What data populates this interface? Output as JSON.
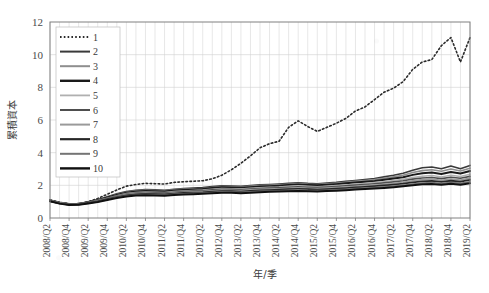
{
  "chart_data": {
    "type": "line",
    "title": "",
    "xlabel": "年/季",
    "ylabel": "累積資本",
    "ylim": [
      0,
      12
    ],
    "yticks": [
      0,
      2,
      4,
      6,
      8,
      10,
      12
    ],
    "grid": true,
    "legend_position": "top-left",
    "x": [
      "2008/Q2",
      "2008/Q3",
      "2008/Q4",
      "2009/Q1",
      "2009/Q2",
      "2009/Q3",
      "2009/Q4",
      "2010/Q1",
      "2010/Q2",
      "2010/Q3",
      "2010/Q4",
      "2011/Q1",
      "2011/Q2",
      "2011/Q3",
      "2011/Q4",
      "2012/Q1",
      "2012/Q2",
      "2012/Q3",
      "2012/Q4",
      "2013/Q1",
      "2013/Q2",
      "2013/Q3",
      "2013/Q4",
      "2014/Q1",
      "2014/Q2",
      "2014/Q3",
      "2014/Q4",
      "2015/Q1",
      "2015/Q2",
      "2015/Q3",
      "2015/Q4",
      "2016/Q1",
      "2016/Q2",
      "2016/Q3",
      "2016/Q4",
      "2017/Q1",
      "2017/Q2",
      "2017/Q3",
      "2017/Q4",
      "2018/Q1",
      "2018/Q2",
      "2018/Q3",
      "2018/Q4",
      "2019/Q1",
      "2019/Q2"
    ],
    "xticklabels": [
      "2008/Q2",
      "2008/Q4",
      "2009/Q2",
      "2009/Q4",
      "2010/Q2",
      "2010/Q4",
      "2011/Q2",
      "2011/Q4",
      "2012/Q2",
      "2012/Q4",
      "2013/Q2",
      "2013/Q4",
      "2014/Q2",
      "2014/Q4",
      "2015/Q2",
      "2015/Q4",
      "2016/Q2",
      "2016/Q4",
      "2017/Q2",
      "2017/Q4",
      "2018/Q2",
      "2018/Q4",
      "2019/Q2"
    ],
    "series": [
      {
        "name": "1",
        "style": "dotted",
        "color": "#2b2b2b",
        "width": 1.3,
        "values": [
          1.1,
          0.95,
          0.86,
          0.88,
          1.0,
          1.2,
          1.45,
          1.72,
          1.95,
          2.05,
          2.12,
          2.1,
          2.08,
          2.18,
          2.22,
          2.25,
          2.28,
          2.4,
          2.62,
          2.95,
          3.35,
          3.8,
          4.3,
          4.55,
          4.7,
          5.55,
          5.95,
          5.6,
          5.3,
          5.55,
          5.8,
          6.1,
          6.55,
          6.8,
          7.25,
          7.7,
          7.95,
          8.35,
          9.1,
          9.55,
          9.7,
          10.55,
          11.05,
          9.55,
          11.05
        ]
      },
      {
        "name": "2",
        "style": "solid",
        "color": "#3a3a3a",
        "width": 1.6,
        "values": [
          1.1,
          0.96,
          0.87,
          0.88,
          0.98,
          1.12,
          1.3,
          1.48,
          1.62,
          1.7,
          1.74,
          1.72,
          1.7,
          1.76,
          1.8,
          1.84,
          1.86,
          1.92,
          1.97,
          1.96,
          1.94,
          1.99,
          2.03,
          2.05,
          2.08,
          2.12,
          2.16,
          2.12,
          2.1,
          2.14,
          2.18,
          2.24,
          2.3,
          2.36,
          2.42,
          2.52,
          2.62,
          2.74,
          2.92,
          3.08,
          3.12,
          3.02,
          3.18,
          3.02,
          3.22
        ]
      },
      {
        "name": "3",
        "style": "solid",
        "color": "#8e8e8e",
        "width": 1.6,
        "values": [
          1.09,
          0.95,
          0.86,
          0.87,
          0.97,
          1.1,
          1.27,
          1.44,
          1.58,
          1.66,
          1.7,
          1.68,
          1.66,
          1.72,
          1.76,
          1.79,
          1.81,
          1.87,
          1.92,
          1.91,
          1.89,
          1.94,
          1.98,
          2.0,
          2.03,
          2.07,
          2.11,
          2.07,
          2.05,
          2.09,
          2.13,
          2.18,
          2.24,
          2.29,
          2.35,
          2.43,
          2.52,
          2.62,
          2.78,
          2.9,
          2.95,
          2.86,
          3.0,
          2.88,
          3.05
        ]
      },
      {
        "name": "4",
        "style": "solid",
        "color": "#1a1a1a",
        "width": 2.0,
        "values": [
          1.08,
          0.94,
          0.85,
          0.86,
          0.96,
          1.09,
          1.25,
          1.41,
          1.55,
          1.62,
          1.66,
          1.64,
          1.62,
          1.68,
          1.72,
          1.75,
          1.77,
          1.83,
          1.88,
          1.87,
          1.85,
          1.89,
          1.93,
          1.95,
          1.98,
          2.02,
          2.05,
          2.02,
          2.0,
          2.03,
          2.07,
          2.12,
          2.17,
          2.22,
          2.27,
          2.34,
          2.42,
          2.5,
          2.64,
          2.74,
          2.78,
          2.7,
          2.82,
          2.72,
          2.88
        ]
      },
      {
        "name": "5",
        "style": "solid",
        "color": "#b0b0b0",
        "width": 1.4,
        "values": [
          1.07,
          0.93,
          0.85,
          0.86,
          0.95,
          1.07,
          1.22,
          1.37,
          1.5,
          1.57,
          1.6,
          1.58,
          1.56,
          1.62,
          1.66,
          1.69,
          1.71,
          1.76,
          1.81,
          1.8,
          1.78,
          1.82,
          1.86,
          1.88,
          1.9,
          1.94,
          1.97,
          1.94,
          1.92,
          1.95,
          1.99,
          2.03,
          2.08,
          2.12,
          2.17,
          2.23,
          2.3,
          2.37,
          2.48,
          2.56,
          2.6,
          2.52,
          2.62,
          2.54,
          2.68
        ]
      },
      {
        "name": "6",
        "style": "solid",
        "color": "#4e4e4e",
        "width": 1.6,
        "values": [
          1.06,
          0.92,
          0.84,
          0.85,
          0.94,
          1.06,
          1.2,
          1.34,
          1.46,
          1.53,
          1.56,
          1.54,
          1.52,
          1.58,
          1.62,
          1.65,
          1.67,
          1.72,
          1.76,
          1.75,
          1.73,
          1.77,
          1.81,
          1.83,
          1.85,
          1.88,
          1.91,
          1.88,
          1.86,
          1.89,
          1.93,
          1.97,
          2.01,
          2.05,
          2.1,
          2.15,
          2.21,
          2.28,
          2.38,
          2.45,
          2.48,
          2.41,
          2.5,
          2.43,
          2.55
        ]
      },
      {
        "name": "7",
        "style": "solid",
        "color": "#9a9a9a",
        "width": 1.6,
        "values": [
          1.05,
          0.91,
          0.83,
          0.84,
          0.93,
          1.04,
          1.18,
          1.31,
          1.43,
          1.49,
          1.52,
          1.5,
          1.48,
          1.54,
          1.58,
          1.6,
          1.62,
          1.67,
          1.71,
          1.7,
          1.68,
          1.72,
          1.75,
          1.77,
          1.79,
          1.82,
          1.85,
          1.82,
          1.8,
          1.83,
          1.86,
          1.9,
          1.94,
          1.98,
          2.02,
          2.07,
          2.13,
          2.19,
          2.28,
          2.35,
          2.38,
          2.31,
          2.39,
          2.33,
          2.44
        ]
      },
      {
        "name": "8",
        "style": "solid",
        "color": "#262626",
        "width": 1.8,
        "values": [
          1.04,
          0.9,
          0.82,
          0.83,
          0.92,
          1.02,
          1.15,
          1.28,
          1.39,
          1.45,
          1.48,
          1.46,
          1.44,
          1.49,
          1.53,
          1.55,
          1.57,
          1.61,
          1.65,
          1.64,
          1.62,
          1.66,
          1.69,
          1.71,
          1.73,
          1.76,
          1.78,
          1.76,
          1.74,
          1.77,
          1.8,
          1.83,
          1.87,
          1.91,
          1.95,
          1.99,
          2.04,
          2.1,
          2.18,
          2.24,
          2.27,
          2.21,
          2.28,
          2.22,
          2.33
        ]
      },
      {
        "name": "9",
        "style": "solid",
        "color": "#747474",
        "width": 1.6,
        "values": [
          1.03,
          0.89,
          0.81,
          0.82,
          0.9,
          1.0,
          1.12,
          1.25,
          1.35,
          1.41,
          1.44,
          1.42,
          1.4,
          1.45,
          1.48,
          1.51,
          1.52,
          1.56,
          1.6,
          1.59,
          1.57,
          1.6,
          1.63,
          1.65,
          1.67,
          1.69,
          1.72,
          1.69,
          1.68,
          1.7,
          1.73,
          1.76,
          1.8,
          1.83,
          1.87,
          1.91,
          1.96,
          2.01,
          2.08,
          2.14,
          2.17,
          2.11,
          2.18,
          2.12,
          2.22
        ]
      },
      {
        "name": "10",
        "style": "solid",
        "color": "#101010",
        "width": 2.0,
        "values": [
          1.02,
          0.88,
          0.8,
          0.81,
          0.89,
          0.98,
          1.1,
          1.22,
          1.32,
          1.37,
          1.4,
          1.38,
          1.36,
          1.41,
          1.44,
          1.46,
          1.48,
          1.52,
          1.55,
          1.54,
          1.52,
          1.55,
          1.58,
          1.6,
          1.62,
          1.64,
          1.66,
          1.64,
          1.62,
          1.65,
          1.67,
          1.7,
          1.74,
          1.77,
          1.8,
          1.84,
          1.89,
          1.94,
          2.0,
          2.06,
          2.08,
          2.03,
          2.09,
          2.04,
          2.13
        ]
      }
    ]
  },
  "legend": {
    "entries": [
      {
        "label": "1"
      },
      {
        "label": "2"
      },
      {
        "label": "3"
      },
      {
        "label": "4"
      },
      {
        "label": "5"
      },
      {
        "label": "6"
      },
      {
        "label": "7"
      },
      {
        "label": "8"
      },
      {
        "label": "9"
      },
      {
        "label": "10"
      }
    ]
  },
  "axes": {
    "y_title": "累積資本",
    "x_title": "年/季",
    "y_tick_labels": [
      "0",
      "2",
      "4",
      "6",
      "8",
      "10",
      "12"
    ]
  }
}
